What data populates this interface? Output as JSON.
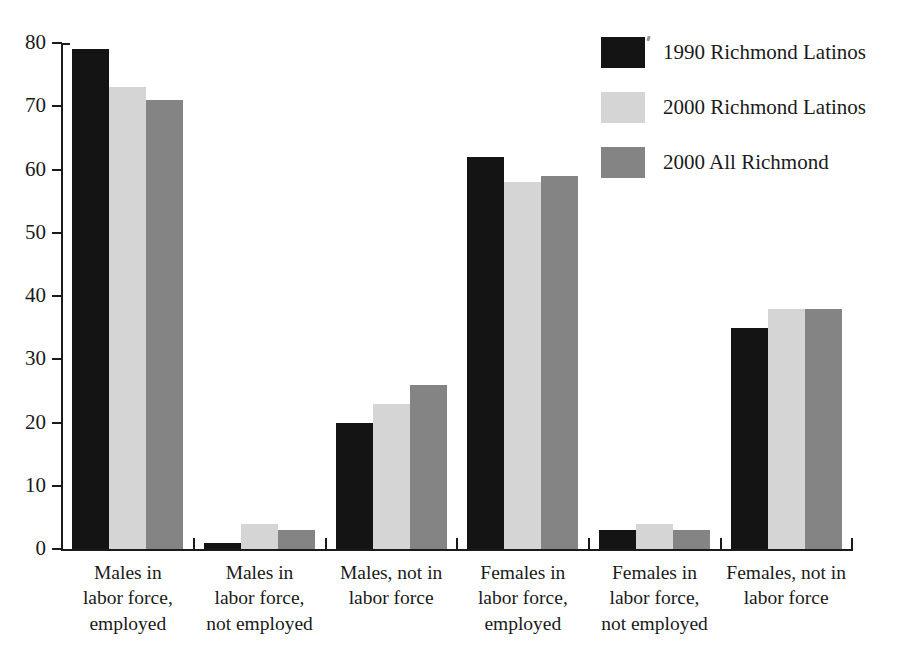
{
  "chart_data": {
    "type": "bar",
    "title": "",
    "subtitle": "",
    "xlabel": "",
    "ylabel": "",
    "ylim": [
      0,
      80
    ],
    "yticks": [
      0,
      10,
      20,
      30,
      40,
      50,
      60,
      70,
      80
    ],
    "ytick_labels": [
      "0",
      "10",
      "20",
      "30",
      "40",
      "50",
      "60",
      "70",
      "80"
    ],
    "grid": false,
    "legend_position": "top-right",
    "orientation": "vertical",
    "grouping": "grouped",
    "categories": [
      "Males in labor force, employed",
      "Males in labor force, not employed",
      "Males, not in labor force",
      "Females in labor force, employed",
      "Females in labor force, not employed",
      "Females, not in labor force"
    ],
    "category_lines": [
      [
        "Males in",
        "labor force,",
        "employed"
      ],
      [
        "Males in",
        "labor force,",
        "not employed"
      ],
      [
        "Males, not in",
        "labor force"
      ],
      [
        "Females in",
        "labor force,",
        "employed"
      ],
      [
        "Females in",
        "labor force,",
        "not employed"
      ],
      [
        "Females, not in",
        "labor force"
      ]
    ],
    "series": [
      {
        "name": "1990 Richmond Latinos",
        "color": "#141414",
        "values": [
          79,
          1,
          20,
          62,
          3,
          35
        ]
      },
      {
        "name": "2000 Richmond Latinos",
        "color": "#d5d5d5",
        "values": [
          73,
          4,
          23,
          58,
          4,
          38
        ]
      },
      {
        "name": "2000 All Richmond",
        "color": "#848484",
        "values": [
          71,
          3,
          26,
          59,
          3,
          38
        ]
      }
    ]
  },
  "legend": {
    "items": [
      {
        "label": "1990 Richmond Latinos",
        "color": "#141414"
      },
      {
        "label": "2000 Richmond Latinos",
        "color": "#d5d5d5"
      },
      {
        "label": "2000 All Richmond",
        "color": "#848484"
      }
    ]
  }
}
